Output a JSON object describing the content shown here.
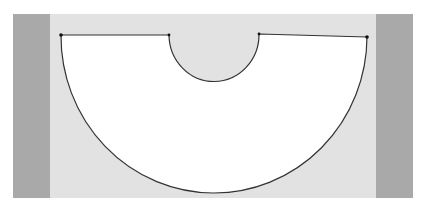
{
  "diagram": {
    "colors": {
      "page_background": "#ffffff",
      "panel_background": "#e2e2e2",
      "side_strips": "#a9a9a9",
      "shape_fill": "#ffffff",
      "outline": "#333333",
      "vertex_markers": "#111111"
    },
    "shape": {
      "vertices": [
        {
          "name": "outer-left",
          "x": 61,
          "y": 35
        },
        {
          "name": "inner-left",
          "x": 169,
          "y": 35
        },
        {
          "name": "inner-right",
          "x": 259,
          "y": 34
        },
        {
          "name": "outer-right",
          "x": 367,
          "y": 37
        }
      ],
      "outer_arc_bottom": {
        "x": 214,
        "y": 192
      },
      "inner_arc_bottom": {
        "x": 214,
        "y": 82
      }
    }
  }
}
